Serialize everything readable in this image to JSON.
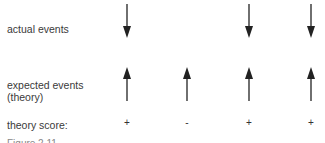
{
  "labels": {
    "actual": "actual events",
    "expected": "expected events\n(theory)",
    "expected_line1": "expected events",
    "expected_line2": "(theory)",
    "score": "theory score:",
    "figure_caption": "Figure 2.11"
  },
  "columns": [
    {
      "x": 127,
      "actual": "down",
      "expected": "up",
      "score": "+"
    },
    {
      "x": 187,
      "actual": null,
      "expected": "up",
      "score": "-"
    },
    {
      "x": 249,
      "actual": "down",
      "expected": "up",
      "score": "+"
    },
    {
      "x": 311,
      "actual": "down",
      "expected": "up",
      "score": "+"
    }
  ],
  "colors": {
    "arrow": "#222222",
    "text": "#3a3a3a"
  }
}
